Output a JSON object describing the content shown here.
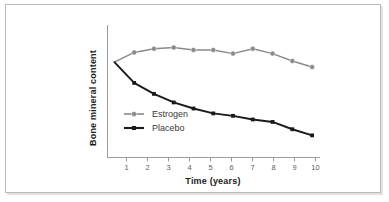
{
  "figure": {
    "border_color": "#b9b9b9",
    "background": "#ffffff"
  },
  "chart_data": {
    "type": "line",
    "title": "",
    "xlabel": "Time (years)",
    "ylabel": "Bone mineral content",
    "x": [
      0,
      1,
      2,
      3,
      4,
      5,
      6,
      7,
      8,
      9,
      10
    ],
    "xtick_labels": [
      "1",
      "2",
      "3",
      "4",
      "5",
      "6",
      "7",
      "8",
      "9",
      "10"
    ],
    "xticks": [
      1,
      2,
      3,
      4,
      5,
      6,
      7,
      8,
      9,
      10
    ],
    "xlim": [
      -0.35,
      10.4
    ],
    "ylim": [
      0,
      100
    ],
    "yticks": [],
    "ytick_labels": [],
    "grid": false,
    "legend_position": "inside-lower-left",
    "series": [
      {
        "name": "Estrogen",
        "color": "#8a8a8a",
        "marker": "circle",
        "values": [
          72,
          80,
          83,
          84,
          82,
          82,
          79,
          83,
          79,
          73,
          68
        ]
      },
      {
        "name": "Placebo",
        "color": "#1a1a1a",
        "marker": "square",
        "values": [
          72,
          55,
          46,
          39,
          34,
          30,
          28,
          25,
          23,
          17,
          12
        ]
      }
    ]
  },
  "legend": {
    "items": [
      {
        "label": "Estrogen",
        "color": "#8a8a8a",
        "marker": "circle"
      },
      {
        "label": "Placebo",
        "color": "#1a1a1a",
        "marker": "square"
      }
    ]
  },
  "axes": {
    "x_axis_label": "Time (years)",
    "y_axis_label": "Bone mineral content",
    "axis_color": "#9a9a9a"
  }
}
